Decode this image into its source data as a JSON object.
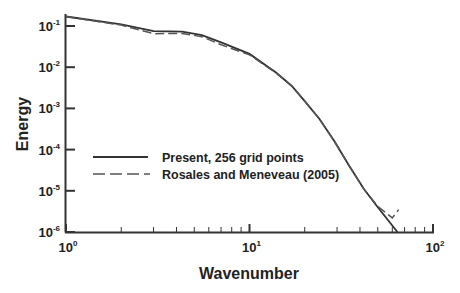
{
  "chart_data": {
    "type": "line",
    "title": "",
    "xlabel": "Wavenumber",
    "ylabel": "Energy",
    "xscale": "log",
    "yscale": "log",
    "xlim": [
      1,
      100
    ],
    "ylim": [
      1e-06,
      0.2
    ],
    "grid": false,
    "legend_position": "center-left",
    "x_tick_labels": [
      {
        "base": "10",
        "exp": "0"
      },
      {
        "base": "10",
        "exp": "1"
      },
      {
        "base": "10",
        "exp": "2"
      }
    ],
    "y_tick_labels": [
      {
        "base": "10",
        "exp": "-1"
      },
      {
        "base": "10",
        "exp": "-2"
      },
      {
        "base": "10",
        "exp": "-3"
      },
      {
        "base": "10",
        "exp": "-4"
      },
      {
        "base": "10",
        "exp": "-5"
      },
      {
        "base": "10",
        "exp": "-6"
      }
    ],
    "series": [
      {
        "name": "Present, 256 grid points",
        "style": "solid",
        "color": "#333333",
        "x": [
          1,
          2,
          3,
          4.3,
          5.5,
          7,
          10,
          14,
          17,
          20,
          24,
          29,
          35,
          42,
          50,
          64
        ],
        "y": [
          0.17,
          0.11,
          0.075,
          0.073,
          0.06,
          0.04,
          0.021,
          0.0073,
          0.0035,
          0.0015,
          0.00056,
          0.00016,
          4e-05,
          1.1e-05,
          4e-06,
          1e-06
        ]
      },
      {
        "name": "Rosales and Meneveau (2005)",
        "style": "dashed",
        "color": "#555555",
        "x": [
          1,
          2,
          3,
          4.3,
          5.5,
          7,
          10,
          14,
          17,
          20,
          24,
          29,
          35,
          42,
          50,
          60,
          65
        ],
        "y": [
          0.17,
          0.105,
          0.065,
          0.066,
          0.055,
          0.035,
          0.02,
          0.0072,
          0.0035,
          0.0015,
          0.00056,
          0.00016,
          4e-05,
          1.1e-05,
          4.2e-06,
          2.2e-06,
          3.5e-06
        ]
      }
    ]
  }
}
